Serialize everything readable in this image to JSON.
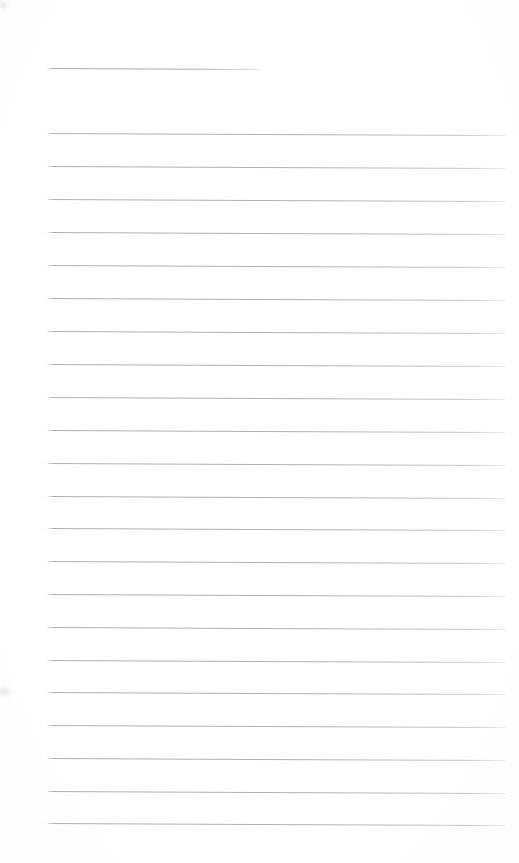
{
  "page": {
    "kind": "lined-notepad-page",
    "width_px": 519,
    "height_px": 863,
    "background_color": "#ffffff",
    "rule_color": "#a8a8b0",
    "content_text": "",
    "handwriting_text": ""
  },
  "header_rule": {
    "name": "header-rule",
    "x_px": 47,
    "y_px": 68,
    "width_px": 216,
    "skew_deg": 0.25
  },
  "ruled_lines": {
    "left_px": 47,
    "right_px": 506,
    "width_px": 459,
    "first_y_px": 133,
    "spacing_px": 32.9,
    "count": 22,
    "skew_deg": 0.25,
    "y_positions": [
      133,
      166,
      199,
      232,
      265,
      298,
      331,
      364,
      397,
      430,
      463,
      496,
      528,
      561,
      594,
      627,
      660,
      692,
      725,
      758,
      791,
      823
    ]
  },
  "smudges": [
    {
      "name": "left-margin-smudge",
      "x_px": 0,
      "y_px": 688,
      "width_px": 9,
      "height_px": 7
    },
    {
      "name": "top-left-smudge",
      "x_px": 0,
      "y_px": 2,
      "width_px": 7,
      "height_px": 6
    }
  ]
}
